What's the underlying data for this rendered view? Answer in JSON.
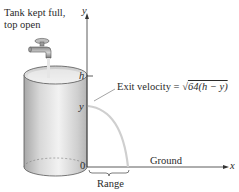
{
  "labels": {
    "tank_note_line1": "Tank kept full,",
    "tank_note_line2": "top open",
    "y_axis": "y",
    "x_axis": "x",
    "h_mark": "h",
    "y_mark": "y",
    "origin": "0",
    "exit_velocity_prefix": "Exit velocity = ",
    "exit_velocity_radical": "√",
    "exit_velocity_radicand": "64(h − y)",
    "ground": "Ground",
    "range": "Range"
  },
  "colors": {
    "tank_fill": "#d9d9d9",
    "tank_edge": "#555555",
    "axis": "#333333",
    "trajectory": "#cfcfcf",
    "water_stream": "#e6e6e6"
  }
}
